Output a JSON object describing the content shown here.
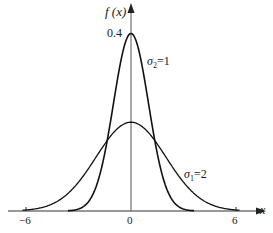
{
  "chart_data": {
    "type": "line",
    "title": "",
    "xlabel": "x",
    "ylabel": "f(x)",
    "xlim": [
      -7,
      7
    ],
    "ylim": [
      0,
      0.42
    ],
    "grid": false,
    "legend": "inline annotations",
    "x_ticks": [
      "-6",
      "0",
      "6"
    ],
    "y_ticks": [
      "0.4"
    ],
    "series": [
      {
        "name": "σ2=1",
        "sigma": 1,
        "mu": 0,
        "peak": 0.399,
        "x": [
          -4,
          -3,
          -2,
          -1,
          0,
          1,
          2,
          3,
          4
        ],
        "values": [
          0.0001,
          0.0044,
          0.054,
          0.242,
          0.399,
          0.242,
          0.054,
          0.0044,
          0.0001
        ]
      },
      {
        "name": "σ1=2",
        "sigma": 2,
        "mu": 0,
        "peak": 0.199,
        "x": [
          -6,
          -4,
          -2,
          0,
          2,
          4,
          6
        ],
        "values": [
          0.0022,
          0.027,
          0.121,
          0.199,
          0.121,
          0.027,
          0.0022
        ]
      }
    ],
    "annotations": [
      "σ2=1",
      "σ1=2",
      "0.4"
    ]
  },
  "labels": {
    "y_axis": "f (x)",
    "x_axis": "x",
    "peak_value": "0.4",
    "tick_neg6": "−6",
    "tick_0": "0",
    "tick_6": "6",
    "sigma2_sym": "σ",
    "sigma2_sub": "2",
    "sigma2_val": "=1",
    "sigma1_sym": "σ",
    "sigma1_sub": "1",
    "sigma1_val": "=2"
  }
}
